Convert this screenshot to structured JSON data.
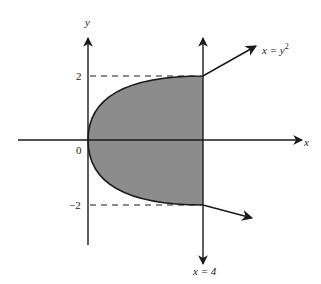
{
  "diagram": {
    "colors": {
      "ink": "#1a1a1a",
      "fill": "#8c8c8c",
      "background": "#ffffff"
    },
    "axes": {
      "x_label": "x",
      "y_label": "y",
      "origin_label": "0"
    },
    "ticks": {
      "y_pos": "2",
      "y_neg": "−2"
    },
    "curves": {
      "parabola_label_main": "x = y",
      "parabola_label_exp": "2",
      "line_label": "x = 4"
    },
    "region": {
      "description": "shaded region between parabola x = y^2 and line x = 4, for -2 <= y <= 2"
    }
  }
}
